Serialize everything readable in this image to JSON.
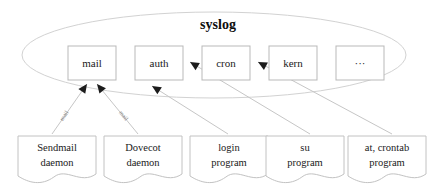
{
  "diagram": {
    "title": "syslog",
    "facilities": [
      {
        "id": "mail",
        "label": "mail",
        "x": 68,
        "y": 46,
        "w": 48,
        "h": 34
      },
      {
        "id": "auth",
        "label": "auth",
        "x": 135,
        "y": 46,
        "w": 48,
        "h": 34
      },
      {
        "id": "cron",
        "label": "cron",
        "x": 202,
        "y": 46,
        "w": 48,
        "h": 34
      },
      {
        "id": "kern",
        "label": "kern",
        "x": 269,
        "y": 46,
        "w": 48,
        "h": 34
      },
      {
        "id": "ellipsis",
        "label": "···",
        "x": 336,
        "y": 46,
        "w": 48,
        "h": 34
      }
    ],
    "sources": [
      {
        "id": "sendmail",
        "line1": "Sendmail",
        "line2": "daemon",
        "x": 18,
        "y": 136,
        "w": 78,
        "h": 46
      },
      {
        "id": "dovecot",
        "line1": "Dovecot",
        "line2": "daemon",
        "x": 104,
        "y": 136,
        "w": 78,
        "h": 46
      },
      {
        "id": "login",
        "line1": "login",
        "line2": "program",
        "x": 190,
        "y": 136,
        "w": 78,
        "h": 46
      },
      {
        "id": "su",
        "line1": "su",
        "line2": "program",
        "x": 266,
        "y": 136,
        "w": 78,
        "h": 46
      },
      {
        "id": "crontab",
        "line1": "at, crontab",
        "line2": "program",
        "x": 348,
        "y": 136,
        "w": 78,
        "h": 46
      }
    ],
    "edges": [
      {
        "id": "sendmail-to-mail",
        "from": "sendmail",
        "to": "mail",
        "label": "mail",
        "x1": 52,
        "y1": 134,
        "x2": 87,
        "y2": 84
      },
      {
        "id": "dovecot-to-mail",
        "from": "dovecot",
        "to": "mail",
        "label": "mail",
        "x1": 138,
        "y1": 134,
        "x2": 97,
        "y2": 84
      },
      {
        "id": "login-to-auth",
        "from": "login",
        "to": "auth",
        "label": "",
        "x1": 228,
        "y1": 134,
        "x2": 152,
        "y2": 86
      },
      {
        "id": "su-to-auth",
        "from": "su",
        "to": "auth",
        "label": "",
        "x1": 310,
        "y1": 134,
        "x2": 190,
        "y2": 62
      },
      {
        "id": "crontab-to-cron",
        "from": "crontab",
        "to": "cron",
        "label": "",
        "x1": 392,
        "y1": 134,
        "x2": 258,
        "y2": 62
      }
    ],
    "group_ellipse": {
      "cx": 214,
      "cy": 55,
      "rx": 192,
      "ry": 43
    },
    "colors": {
      "box_stroke": "#b9b9b9",
      "doc_stroke": "#c2c2c2",
      "ellipse_stroke": "#d2d2d2",
      "edge_stroke": "#c6c6c6",
      "arrow_fill": "#1c1c1c",
      "text": "#1a1a1a",
      "edge_label": "#7a7a7a",
      "background": "#ffffff"
    }
  }
}
